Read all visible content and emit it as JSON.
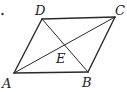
{
  "figure": {
    "type": "parallelogram",
    "stroke_color": "#2a2a2a",
    "points": {
      "A": {
        "label": "A",
        "x": 14,
        "y": 73
      },
      "B": {
        "label": "B",
        "x": 88,
        "y": 72
      },
      "C": {
        "label": "C",
        "x": 115,
        "y": 17
      },
      "D": {
        "label": "D",
        "x": 42,
        "y": 19
      },
      "E": {
        "label": "E"
      }
    },
    "segments": [
      "AB",
      "BC",
      "CD",
      "DA",
      "AC",
      "BD"
    ],
    "diagonal_intersection": "E"
  }
}
